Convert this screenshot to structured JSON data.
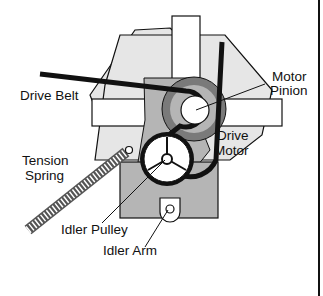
{
  "diagram": {
    "title_cut": "",
    "labels": {
      "drive_belt": "Drive Belt",
      "motor_pinion_line1": "Motor",
      "motor_pinion_line2": "Pinion",
      "drive_motor_line1": "Drive",
      "drive_motor_line2": "Motor",
      "tension_spring_line1": "Tension",
      "tension_spring_line2": "Spring",
      "idler_pulley": "Idler  Pulley",
      "idler_arm": "Idler  Arm"
    },
    "colors": {
      "outline": "#111111",
      "light_fill": "#e6e6e6",
      "mid_fill": "#b5b5b5",
      "dark_fill": "#7a7a7a",
      "white": "#ffffff"
    }
  }
}
